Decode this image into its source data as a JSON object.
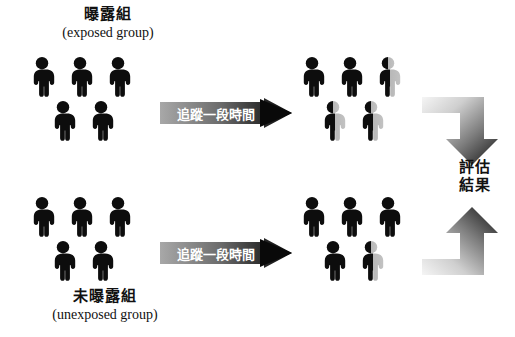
{
  "diagram": {
    "title_cn": "",
    "groups": [
      {
        "id": "exposed",
        "label_cn": "曝露組",
        "label_en": "(exposed group)",
        "label_position": "above",
        "baseline_people_count": 5,
        "baseline_people": [
          {
            "state": "solid"
          },
          {
            "state": "solid"
          },
          {
            "state": "solid"
          },
          {
            "state": "solid"
          },
          {
            "state": "solid"
          }
        ],
        "followup_people": [
          {
            "state": "solid"
          },
          {
            "state": "solid"
          },
          {
            "state": "half-faded"
          },
          {
            "state": "half-faded"
          },
          {
            "state": "half-faded"
          }
        ]
      },
      {
        "id": "unexposed",
        "label_cn": "未曝露組",
        "label_en": "(unexposed group)",
        "label_position": "below",
        "baseline_people_count": 5,
        "baseline_people": [
          {
            "state": "solid"
          },
          {
            "state": "solid"
          },
          {
            "state": "solid"
          },
          {
            "state": "solid"
          },
          {
            "state": "solid"
          }
        ],
        "followup_people": [
          {
            "state": "solid"
          },
          {
            "state": "solid"
          },
          {
            "state": "solid"
          },
          {
            "state": "solid"
          },
          {
            "state": "half-faded"
          }
        ]
      }
    ],
    "follow_up_banner": {
      "label": "追蹤一段時間",
      "count": 2,
      "direction": "right"
    },
    "outcome": {
      "line1": "評估",
      "line2": "結果",
      "arrow_top_direction": "down",
      "arrow_bottom_direction": "up"
    },
    "colors": {
      "figure_solid": "#0d0d0d",
      "figure_faded": "#b5b5b5",
      "banner_gradient_start": "#9a9a9a",
      "banner_gradient_end": "#111111",
      "arrow_gradient_start": "#f2f2f2",
      "arrow_gradient_end": "#1a1a1a",
      "text": "#111111",
      "background": "#ffffff"
    }
  }
}
